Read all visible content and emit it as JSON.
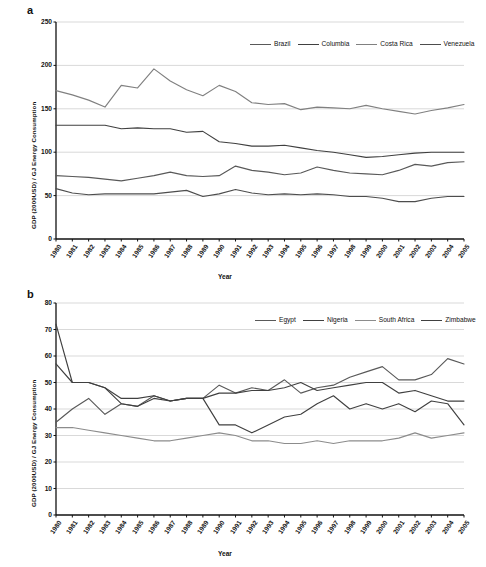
{
  "panels": [
    {
      "letter": "a",
      "ylabel": "GDP (2000USD) / GJ Energy Consumption",
      "xlabel": "Year"
    },
    {
      "letter": "b",
      "ylabel": "GDP (2000USD) / GJ Energy Consumption",
      "xlabel": "Year"
    }
  ],
  "chart_data": [
    {
      "type": "line",
      "panel": "a",
      "title": "",
      "xlabel": "Year",
      "ylabel": "GDP (2000USD) / GJ Energy Consumption",
      "x": [
        1980,
        1981,
        1982,
        1983,
        1984,
        1985,
        1986,
        1987,
        1988,
        1989,
        1990,
        1991,
        1992,
        1993,
        1994,
        1995,
        1996,
        1997,
        1998,
        1999,
        2000,
        2001,
        2002,
        2003,
        2004,
        2005
      ],
      "xticklabels": [
        "1980",
        "1981",
        "1982",
        "1983",
        "1984",
        "1985",
        "1986",
        "1987",
        "1988",
        "1989",
        "1990",
        "1991",
        "1992",
        "1993",
        "1994",
        "1995",
        "1996",
        "1997",
        "1998",
        "1999",
        "2000",
        "2001",
        "2002",
        "2003",
        "2004",
        "2005"
      ],
      "yticks": [
        0,
        50,
        100,
        150,
        200,
        250
      ],
      "ylim": [
        0,
        250
      ],
      "grid": "horizontal",
      "legend_position": "top-right",
      "series": [
        {
          "name": "Brazil",
          "color": "#595959",
          "values": [
            73,
            72,
            71,
            69,
            67,
            70,
            73,
            77,
            73,
            72,
            73,
            84,
            79,
            77,
            74,
            76,
            83,
            79,
            76,
            75,
            74,
            79,
            86,
            84,
            88,
            89
          ]
        },
        {
          "name": "Columbia",
          "color": "#404040",
          "values": [
            131,
            131,
            131,
            131,
            127,
            128,
            127,
            127,
            123,
            124,
            112,
            110,
            107,
            107,
            108,
            105,
            102,
            100,
            97,
            94,
            95,
            97,
            99,
            100,
            100,
            100
          ]
        },
        {
          "name": "Costa Rica",
          "color": "#808080",
          "values": [
            171,
            166,
            160,
            152,
            177,
            174,
            196,
            182,
            172,
            165,
            177,
            170,
            157,
            155,
            156,
            149,
            152,
            151,
            150,
            154,
            150,
            147,
            144,
            148,
            151,
            155
          ]
        },
        {
          "name": "Venezuela",
          "color": "#4d4d4d",
          "values": [
            58,
            53,
            51,
            52,
            52,
            52,
            52,
            54,
            56,
            49,
            52,
            57,
            53,
            51,
            52,
            51,
            52,
            51,
            49,
            49,
            47,
            43,
            43,
            47,
            49,
            49
          ]
        }
      ]
    },
    {
      "type": "line",
      "panel": "b",
      "title": "",
      "xlabel": "Year",
      "ylabel": "GDP (2000USD) / GJ Energy Consumption",
      "x": [
        1980,
        1981,
        1982,
        1983,
        1984,
        1985,
        1986,
        1987,
        1988,
        1989,
        1990,
        1991,
        1992,
        1993,
        1994,
        1995,
        1996,
        1997,
        1998,
        1999,
        2000,
        2001,
        2002,
        2003,
        2004,
        2005
      ],
      "xticklabels": [
        "1980",
        "1981",
        "1982",
        "1983",
        "1984",
        "1985",
        "1986",
        "1987",
        "1988",
        "1989",
        "1990",
        "1991",
        "1992",
        "1993",
        "1994",
        "1995",
        "1996",
        "1997",
        "1998",
        "1999",
        "2000",
        "2001",
        "2002",
        "2003",
        "2004",
        "2005"
      ],
      "yticks": [
        0,
        10,
        20,
        30,
        40,
        50,
        60,
        70,
        80
      ],
      "ylim": [
        0,
        80
      ],
      "grid": "horizontal",
      "legend_position": "top-right",
      "series": [
        {
          "name": "Egypt",
          "color": "#595959",
          "values": [
            35,
            40,
            44,
            38,
            42,
            41,
            45,
            43,
            44,
            44,
            49,
            46,
            48,
            47,
            51,
            46,
            48,
            49,
            52,
            54,
            56,
            51,
            51,
            53,
            59,
            57
          ]
        },
        {
          "name": "Nigeria",
          "color": "#404040",
          "values": [
            72,
            50,
            50,
            48,
            44,
            44,
            45,
            43,
            44,
            44,
            46,
            46,
            47,
            47,
            48,
            50,
            47,
            48,
            49,
            50,
            50,
            46,
            47,
            45,
            43,
            43
          ]
        },
        {
          "name": "South Africa",
          "color": "#8c8c8c",
          "values": [
            33,
            33,
            32,
            31,
            30,
            29,
            28,
            28,
            29,
            30,
            31,
            30,
            28,
            28,
            27,
            27,
            28,
            27,
            28,
            28,
            28,
            29,
            31,
            29,
            30,
            31
          ]
        },
        {
          "name": "Zimbabwe",
          "color": "#404040",
          "values": [
            57,
            50,
            50,
            48,
            42,
            41,
            44,
            43,
            44,
            44,
            34,
            34,
            31,
            34,
            37,
            38,
            42,
            45,
            40,
            42,
            40,
            42,
            39,
            43,
            42,
            34
          ]
        }
      ]
    }
  ]
}
